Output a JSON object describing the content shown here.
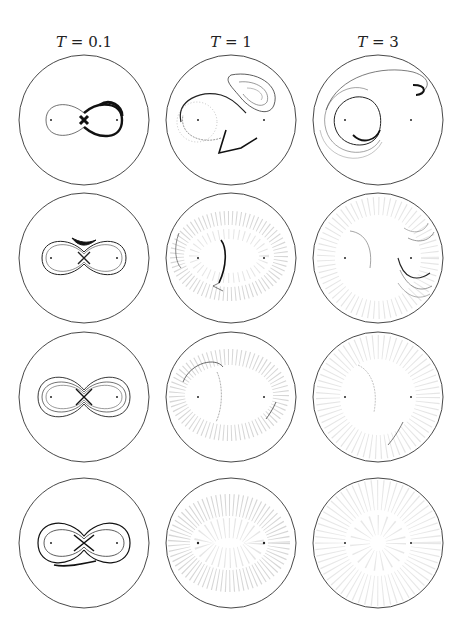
{
  "figure": {
    "columns": [
      {
        "var": "T",
        "op": " = ",
        "value": "0.1"
      },
      {
        "var": "T",
        "op": " = ",
        "value": "1"
      },
      {
        "var": "T",
        "op": " = ",
        "value": "3"
      }
    ],
    "rows": 4,
    "panel_shape": "circle",
    "vortex_markers_per_panel": 2,
    "line_color": "#222222",
    "background_color": "#ffffff"
  },
  "panels": [
    {
      "row": 1,
      "col": 1,
      "T": "0.1",
      "pattern": "figure-eight filament, thick lobe on right"
    },
    {
      "row": 1,
      "col": 2,
      "T": "1",
      "pattern": "spiral around left vortex, tear-drop lobe upper right"
    },
    {
      "row": 1,
      "col": 3,
      "T": "3",
      "pattern": "large spiral filaments around left vortex, long arm to upper right"
    },
    {
      "row": 2,
      "col": 1,
      "T": "0.1",
      "pattern": "figure-eight with thickened central band"
    },
    {
      "row": 2,
      "col": 2,
      "T": "1",
      "pattern": "diffuse scatter with dark vertical filament at center"
    },
    {
      "row": 2,
      "col": 3,
      "T": "3",
      "pattern": "diffuse scatter with nested arcs at right"
    },
    {
      "row": 3,
      "col": 1,
      "T": "0.1",
      "pattern": "multiple nested figure-eight loops"
    },
    {
      "row": 3,
      "col": 2,
      "T": "1",
      "pattern": "diffuse scatter with faint arcs"
    },
    {
      "row": 3,
      "col": 3,
      "T": "3",
      "pattern": "near-uniform diffuse scatter, faint arcs"
    },
    {
      "row": 4,
      "col": 1,
      "T": "0.1",
      "pattern": "dense figure-eight loops with tail bottom"
    },
    {
      "row": 4,
      "col": 2,
      "T": "1",
      "pattern": "oval-shaped diffuse cloud"
    },
    {
      "row": 4,
      "col": 3,
      "T": "3",
      "pattern": "uniform diffuse cloud filling disk"
    }
  ]
}
